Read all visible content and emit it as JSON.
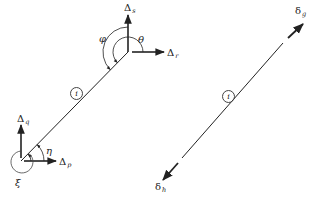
{
  "figure": {
    "left_member": {
      "member_label": "i",
      "end_p": {
        "x_disp_label": {
          "main": "Δ",
          "sub": "p"
        },
        "y_disp_label": {
          "main": "Δ",
          "sub": "q"
        },
        "rotation_label": "ξ",
        "angle_label": "η"
      },
      "end_s": {
        "x_disp_label": {
          "main": "Δ",
          "sub": "r"
        },
        "y_disp_label": {
          "main": "Δ",
          "sub": "s"
        },
        "angle_theta_label": "θ",
        "angle_phi_label": "φ"
      }
    },
    "right_member": {
      "member_label": "i",
      "end_g_label": {
        "main": "δ",
        "sub": "g"
      },
      "end_h_label": {
        "main": "δ",
        "sub": "h"
      }
    },
    "colors": {
      "line": "#222222",
      "background": "#ffffff"
    }
  }
}
